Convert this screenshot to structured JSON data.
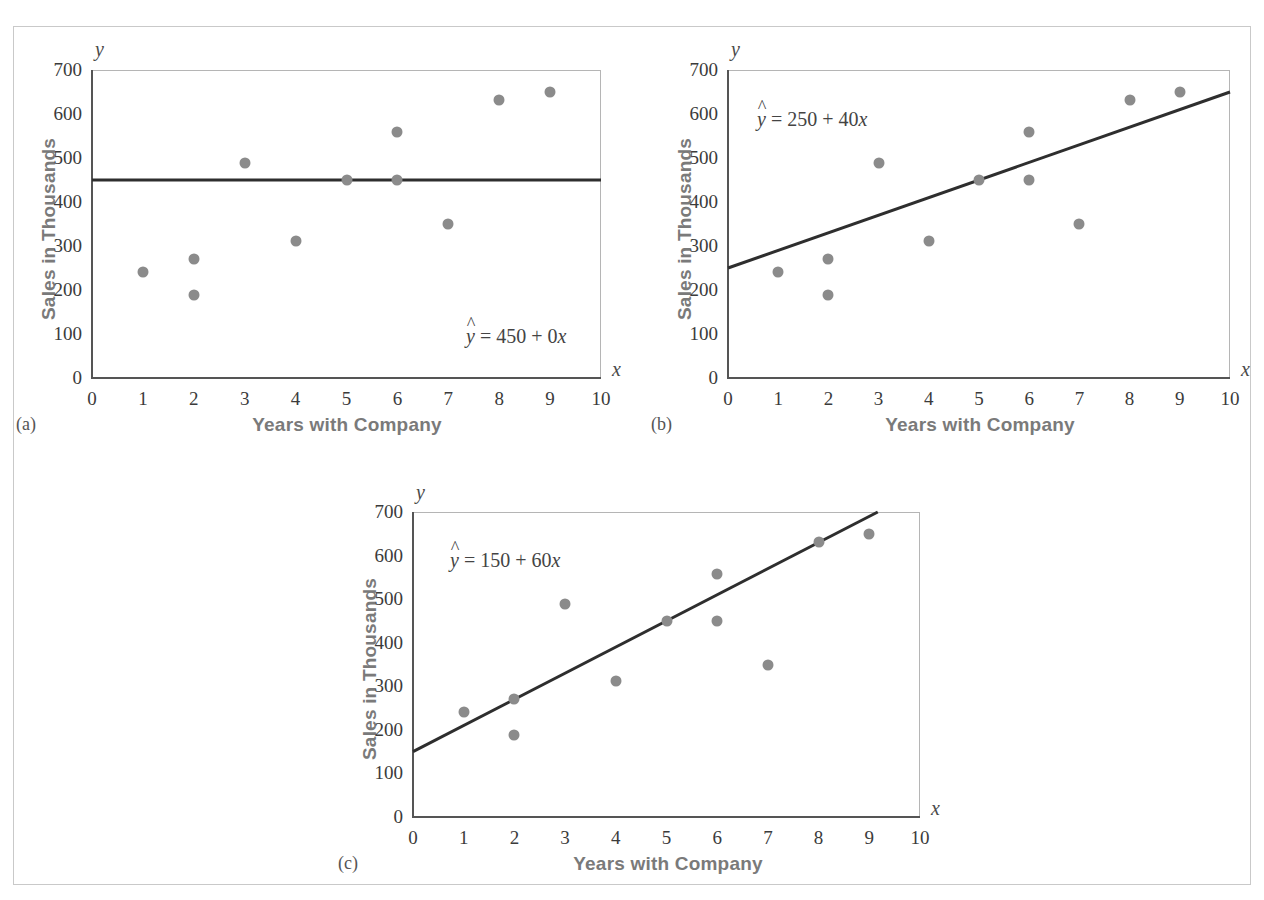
{
  "figure": {
    "background_color": "#ffffff",
    "border_color": "#c9c9c9",
    "point_color": "#8b8b8b",
    "line_color": "#2e2e2e",
    "axis_title_color": "#7a7a7a"
  },
  "shared": {
    "xlabel": "Years with Company",
    "ylabel": "Sales in Thousands",
    "x_axis_letter": "x",
    "y_axis_letter": "y",
    "x_ticks": [
      "0",
      "1",
      "2",
      "3",
      "4",
      "5",
      "6",
      "7",
      "8",
      "9",
      "10"
    ],
    "y_ticks": [
      "0",
      "100",
      "200",
      "300",
      "400",
      "500",
      "600",
      "700"
    ]
  },
  "panels": [
    {
      "caption": "(a)",
      "equation_lhs": "y",
      "equation_rhs": " = 450 + 0",
      "equation_var": "x",
      "equation_full": "ŷ = 450 + 0x"
    },
    {
      "caption": "(b)",
      "equation_lhs": "y",
      "equation_rhs": " = 250 + 40",
      "equation_var": "x",
      "equation_full": "ŷ = 250 + 40x"
    },
    {
      "caption": "(c)",
      "equation_lhs": "y",
      "equation_rhs": " = 150 + 60",
      "equation_var": "x",
      "equation_full": "ŷ = 150 + 60x"
    }
  ],
  "chart_data": [
    {
      "type": "scatter",
      "panel": "(a)",
      "title": "",
      "xlabel": "Years with Company",
      "ylabel": "Sales in Thousands",
      "xlim": [
        0,
        10
      ],
      "ylim": [
        0,
        700
      ],
      "xticks": [
        0,
        1,
        2,
        3,
        4,
        5,
        6,
        7,
        8,
        9,
        10
      ],
      "yticks": [
        0,
        100,
        200,
        300,
        400,
        500,
        600,
        700
      ],
      "grid": false,
      "legend": "none",
      "x": [
        1,
        2,
        2,
        3,
        4,
        5,
        6,
        6,
        7,
        8,
        9
      ],
      "y": [
        240,
        270,
        188,
        489,
        312,
        450,
        558,
        450,
        350,
        632,
        650
      ],
      "fit_line": {
        "label": "ŷ = 450 + 0x",
        "intercept": 450,
        "slope": 0,
        "x_start": 0,
        "x_end": 10,
        "y_start": 450,
        "y_end": 450
      },
      "annotation_position": "bottom-right"
    },
    {
      "type": "scatter",
      "panel": "(b)",
      "title": "",
      "xlabel": "Years with Company",
      "ylabel": "Sales in Thousands",
      "xlim": [
        0,
        10
      ],
      "ylim": [
        0,
        700
      ],
      "xticks": [
        0,
        1,
        2,
        3,
        4,
        5,
        6,
        7,
        8,
        9,
        10
      ],
      "yticks": [
        0,
        100,
        200,
        300,
        400,
        500,
        600,
        700
      ],
      "grid": false,
      "legend": "none",
      "x": [
        1,
        2,
        2,
        3,
        4,
        5,
        6,
        6,
        7,
        8,
        9
      ],
      "y": [
        240,
        270,
        188,
        489,
        312,
        450,
        558,
        450,
        350,
        632,
        650
      ],
      "fit_line": {
        "label": "ŷ = 250 + 40x",
        "intercept": 250,
        "slope": 40,
        "x_start": 0,
        "x_end": 10,
        "y_start": 250,
        "y_end": 650
      },
      "annotation_position": "top-left"
    },
    {
      "type": "scatter",
      "panel": "(c)",
      "title": "",
      "xlabel": "Years with Company",
      "ylabel": "Sales in Thousands",
      "xlim": [
        0,
        10
      ],
      "ylim": [
        0,
        700
      ],
      "xticks": [
        0,
        1,
        2,
        3,
        4,
        5,
        6,
        7,
        8,
        9,
        10
      ],
      "yticks": [
        0,
        100,
        200,
        300,
        400,
        500,
        600,
        700
      ],
      "grid": false,
      "legend": "none",
      "x": [
        1,
        2,
        2,
        3,
        4,
        5,
        6,
        6,
        7,
        8,
        9
      ],
      "y": [
        240,
        270,
        188,
        489,
        312,
        450,
        558,
        450,
        350,
        632,
        650
      ],
      "fit_line": {
        "label": "ŷ = 150 + 60x",
        "intercept": 150,
        "slope": 60,
        "x_start": 0,
        "x_end": 9.1667,
        "y_start": 150,
        "y_end": 700
      },
      "annotation_position": "top-left"
    }
  ]
}
